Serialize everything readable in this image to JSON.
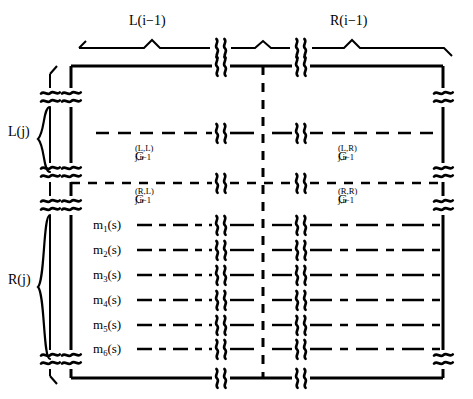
{
  "figure": {
    "type": "ladder-network-block-diagram",
    "top_labels": [
      {
        "id": "top-left-span",
        "text": "L(i−1)"
      },
      {
        "id": "top-right-span",
        "text": "R(i−1)"
      }
    ],
    "side_labels": [
      {
        "id": "left-upper-brace",
        "text": "L(j)"
      },
      {
        "id": "left-lower-brace",
        "text": "R(j)"
      }
    ],
    "block_labels": [
      {
        "id": "g-left-left",
        "base": "G",
        "sup": "(L,L)",
        "sub": "j,i−1"
      },
      {
        "id": "g-left-right",
        "base": "G",
        "sup": "(L,R)",
        "sub": "j,i−1"
      },
      {
        "id": "g-right-left",
        "base": "G",
        "sup": "(R,L)",
        "sub": "j,i−1"
      },
      {
        "id": "g-right-right",
        "base": "G",
        "sup": "(R,R)",
        "sub": "j,i−1"
      }
    ],
    "row_labels": [
      {
        "id": "row-m1",
        "base": "m",
        "sub": "1",
        "arg": "(s)"
      },
      {
        "id": "row-m2",
        "base": "m",
        "sub": "2",
        "arg": "(s)"
      },
      {
        "id": "row-m3",
        "base": "m",
        "sub": "3",
        "arg": "(s)"
      },
      {
        "id": "row-m4",
        "base": "m",
        "sub": "4",
        "arg": "(s)"
      },
      {
        "id": "row-m5",
        "base": "m",
        "sub": "5",
        "arg": "(s)"
      },
      {
        "id": "row-m6",
        "base": "m",
        "sub": "6",
        "arg": "(s)"
      }
    ],
    "colors": {
      "stroke": "#000000",
      "background": "#ffffff"
    },
    "symbols": {
      "break_vertical": "double-squiggle-break",
      "break_horizontal": "double-squiggle-break-rotated",
      "divider": "vertical-dashed-line",
      "brace": "curly-brace"
    }
  }
}
